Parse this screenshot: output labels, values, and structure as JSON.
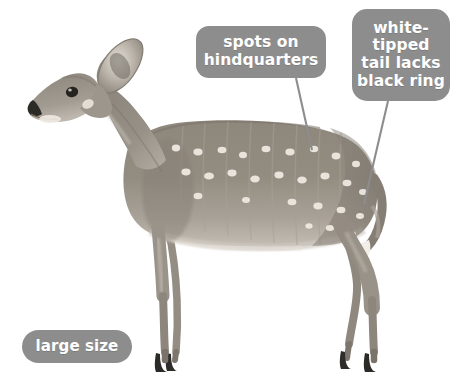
{
  "figure": {
    "background_color": "#ffffff",
    "body_color": "#8b8378",
    "spot_color": "#f2efe8",
    "hoof_color": "#2b2b2b",
    "callout_color": "#8d8d8d",
    "callout_text_color": "#ffffff",
    "leader_line_color": "#8d8d8d"
  },
  "callouts": [
    {
      "id": "spots",
      "lines": [
        "spots on",
        "hindquarters"
      ],
      "text": "spots on hindquarters"
    },
    {
      "id": "tail",
      "lines": [
        "white-",
        "tipped",
        "tail lacks",
        "black ring"
      ],
      "text": "white-tipped tail lacks black ring"
    },
    {
      "id": "size",
      "lines": [
        "large size"
      ],
      "text": "large size"
    }
  ]
}
